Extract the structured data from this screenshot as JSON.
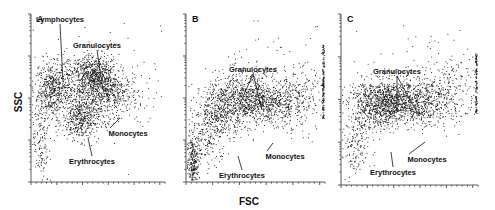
{
  "figure": {
    "x_label": "FSC",
    "y_label": "SSC",
    "colors": {
      "dots": "#111111",
      "axis": "#333333",
      "text": "#111111",
      "background": "#ffffff"
    }
  },
  "chart_data": [
    {
      "type": "scatter",
      "panel": "A",
      "title": "A",
      "xlabel": "FSC",
      "ylabel": "SSC",
      "grid": false,
      "x_scale": "linear",
      "y_scale": "log",
      "y_ticks_major": 4,
      "annotations": [
        {
          "label": "Lymphocytes",
          "text_xy": [
            60,
            22
          ],
          "arrow_to": [
            [
              63,
              82
            ]
          ]
        },
        {
          "label": "Granulocytes",
          "text_xy": [
            97,
            48
          ],
          "arrow_to": [
            [
              103,
              90
            ]
          ]
        },
        {
          "label": "Monocytes",
          "text_xy": [
            128,
            136
          ],
          "arrow_to": [
            [
              120,
              118
            ]
          ]
        },
        {
          "label": "Erythrocytes",
          "text_xy": [
            92,
            164
          ],
          "arrow_to": [
            [
              88,
              138
            ]
          ]
        }
      ],
      "clusters": [
        {
          "name": "Lymphocytes",
          "cx": 0.15,
          "cy": 0.55,
          "sx": 0.05,
          "sy": 0.08,
          "n": 350
        },
        {
          "name": "Granulocytes",
          "cx": 0.47,
          "cy": 0.64,
          "sx": 0.09,
          "sy": 0.06,
          "n": 550
        },
        {
          "name": "Monocytes",
          "cx": 0.6,
          "cy": 0.52,
          "sx": 0.1,
          "sy": 0.06,
          "n": 300
        },
        {
          "name": "Erythrocytes",
          "cx": 0.37,
          "cy": 0.37,
          "sx": 0.07,
          "sy": 0.06,
          "n": 380
        },
        {
          "name": "Mixed",
          "cx": 0.35,
          "cy": 0.55,
          "sx": 0.17,
          "sy": 0.1,
          "n": 700
        },
        {
          "name": "Debris",
          "cx": 0.07,
          "cy": 0.25,
          "sx": 0.03,
          "sy": 0.14,
          "n": 140
        },
        {
          "name": "Sparse",
          "cx": 0.7,
          "cy": 0.6,
          "sx": 0.25,
          "sy": 0.18,
          "n": 90
        }
      ]
    },
    {
      "type": "scatter",
      "panel": "B",
      "title": "B",
      "xlabel": "FSC",
      "ylabel": "SSC",
      "grid": false,
      "x_scale": "linear",
      "y_scale": "log",
      "annotations": [
        {
          "label": "Granulocytes",
          "text_xy": [
            253,
            72
          ],
          "arrow_to": [
            [
              240,
              104
            ],
            [
              262,
              110
            ]
          ]
        },
        {
          "label": "Monocytes",
          "text_xy": [
            285,
            159
          ],
          "arrow_to": [
            [
              273,
              143
            ]
          ]
        },
        {
          "label": "Erythrocytes",
          "text_xy": [
            242,
            178
          ],
          "arrow_to": [
            [
              238,
              156
            ]
          ]
        }
      ],
      "clusters": [
        {
          "name": "Granulocytes",
          "cx": 0.4,
          "cy": 0.5,
          "sx": 0.13,
          "sy": 0.08,
          "n": 700
        },
        {
          "name": "Monocytes",
          "cx": 0.6,
          "cy": 0.47,
          "sx": 0.11,
          "sy": 0.06,
          "n": 450
        },
        {
          "name": "Erythrocytes",
          "cx": 0.25,
          "cy": 0.42,
          "sx": 0.09,
          "sy": 0.07,
          "n": 350
        },
        {
          "name": "Tail",
          "cx": 0.8,
          "cy": 0.5,
          "sx": 0.1,
          "sy": 0.1,
          "n": 220
        },
        {
          "name": "Debris",
          "cx": 0.05,
          "cy": 0.12,
          "sx": 0.025,
          "sy": 0.08,
          "n": 280
        },
        {
          "name": "LowMid",
          "cx": 0.15,
          "cy": 0.25,
          "sx": 0.07,
          "sy": 0.08,
          "n": 180
        },
        {
          "name": "Sparse",
          "cx": 0.6,
          "cy": 0.65,
          "sx": 0.25,
          "sy": 0.15,
          "n": 70
        }
      ],
      "edge_band": {
        "x": 0.985,
        "y0": 0.38,
        "y1": 0.82,
        "n": 120
      }
    },
    {
      "type": "scatter",
      "panel": "C",
      "title": "C",
      "xlabel": "FSC",
      "ylabel": "SSC",
      "grid": false,
      "x_scale": "linear",
      "y_scale": "log",
      "annotations": [
        {
          "label": "Granulocytes",
          "text_xy": [
            397,
            74
          ],
          "arrow_to": [
            [
              397,
              110
            ],
            [
              419,
              116
            ]
          ]
        },
        {
          "label": "Monocytes",
          "text_xy": [
            427,
            162
          ],
          "arrow_to": [
            [
              425,
              142
            ]
          ]
        },
        {
          "label": "Erythrocytes",
          "text_xy": [
            393,
            175
          ],
          "arrow_to": [
            [
              391,
              152
            ]
          ]
        }
      ],
      "clusters": [
        {
          "name": "Erythrocytes",
          "cx": 0.27,
          "cy": 0.47,
          "sx": 0.11,
          "sy": 0.07,
          "n": 700
        },
        {
          "name": "Granulocytes",
          "cx": 0.4,
          "cy": 0.5,
          "sx": 0.13,
          "sy": 0.07,
          "n": 550
        },
        {
          "name": "Monocytes",
          "cx": 0.58,
          "cy": 0.48,
          "sx": 0.1,
          "sy": 0.06,
          "n": 380
        },
        {
          "name": "Tail",
          "cx": 0.8,
          "cy": 0.53,
          "sx": 0.11,
          "sy": 0.1,
          "n": 200
        },
        {
          "name": "LowLeft",
          "cx": 0.1,
          "cy": 0.22,
          "sx": 0.05,
          "sy": 0.1,
          "n": 160
        },
        {
          "name": "Sparse",
          "cx": 0.65,
          "cy": 0.68,
          "sx": 0.22,
          "sy": 0.12,
          "n": 80
        }
      ],
      "edge_band": {
        "x": 0.985,
        "y0": 0.42,
        "y1": 0.78,
        "n": 90
      }
    }
  ],
  "panels_layout": [
    {
      "x0": 31,
      "y0": 14,
      "x1": 165,
      "y1": 182
    },
    {
      "x0": 186,
      "y0": 14,
      "x1": 325,
      "y1": 182
    },
    {
      "x0": 341,
      "y0": 14,
      "x1": 478,
      "y1": 185
    }
  ]
}
